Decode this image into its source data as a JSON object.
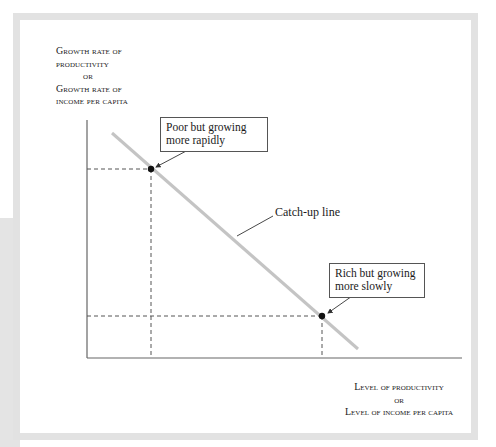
{
  "axes": {
    "y_label": {
      "line1": "Growth rate of",
      "line2": "productivity",
      "or": "or",
      "line3": "Growth rate of",
      "line4": "income per capita"
    },
    "x_label": {
      "line1": "Level of productivity",
      "or": "or",
      "line2": "Level of income per capita"
    }
  },
  "line": {
    "label": "Catch-up line",
    "color": "#c4c4c4",
    "start": [
      112,
      133
    ],
    "end": [
      358,
      349
    ]
  },
  "points": [
    {
      "id": "poor",
      "label_line1": "Poor but growing",
      "label_line2": "more rapidly",
      "x": 151,
      "y": 169
    },
    {
      "id": "rich",
      "label_line1": "Rich but growing",
      "label_line2": "more slowly",
      "x": 322,
      "y": 316
    }
  ],
  "colors": {
    "frame": "#e2e2e2",
    "axis": "#666666",
    "dashed": "#555555",
    "point": "#111111"
  }
}
